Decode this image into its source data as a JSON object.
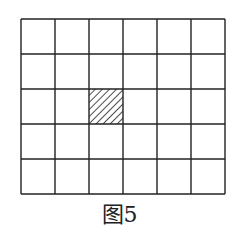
{
  "figure": {
    "caption": "图5",
    "grid": {
      "columns": 6,
      "rows": 5,
      "origin_x": 21,
      "origin_y": 19,
      "cell_width": 34,
      "cell_height": 35,
      "line_color": "#222222",
      "line_width": 1.4
    },
    "shaded_cells": [
      {
        "row": 3,
        "col": 3,
        "pattern": "diagonal-hatch"
      }
    ]
  }
}
